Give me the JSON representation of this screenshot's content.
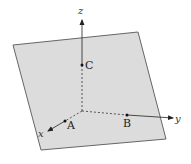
{
  "figure": {
    "colors": {
      "plane_fill": "#dcdcdc",
      "plane_edge": "#666666",
      "axis": "#222222",
      "point": "#111111"
    },
    "plane": {
      "corners": [
        [
          13,
          45
        ],
        [
          138,
          32
        ],
        [
          166,
          139
        ],
        [
          41,
          150
        ]
      ]
    },
    "origin": [
      82,
      111
    ],
    "axes": [
      {
        "name": "x",
        "label": "x",
        "intercept_point": "A",
        "arrow_tip": [
          48,
          131
        ],
        "label_pos": [
          40,
          136
        ]
      },
      {
        "name": "y",
        "label": "y",
        "intercept_point": "B",
        "arrow_tip": [
          173,
          118
        ],
        "label_pos": [
          176,
          121
        ]
      },
      {
        "name": "z",
        "label": "z",
        "intercept_point": "C",
        "arrow_tip": [
          82,
          20
        ],
        "label_pos": [
          78,
          14
        ]
      }
    ],
    "points": [
      {
        "name": "A",
        "label": "A",
        "pos": [
          65,
          121
        ],
        "label_pos": [
          68,
          129
        ]
      },
      {
        "name": "B",
        "label": "B",
        "pos": [
          127,
          115
        ],
        "label_pos": [
          123,
          126
        ]
      },
      {
        "name": "C",
        "label": "C",
        "pos": [
          82,
          65
        ],
        "label_pos": [
          85,
          69
        ]
      }
    ]
  }
}
